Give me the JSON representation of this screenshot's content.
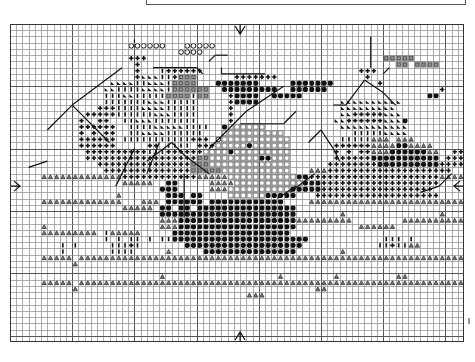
{
  "pattern": {
    "title": "Ship cross-stitch chart",
    "cols": 73,
    "rows": 51,
    "colors": {
      "grid": "#8a8a8a",
      "grid_major": "#555555",
      "ink": "#111111",
      "gray_fill": "#9a9a9a"
    },
    "legend_symbols": {
      "D": "filled-circle",
      "O": "ring-on-gray",
      "P": "plus",
      "A": "triangle",
      "S": "slash",
      "I": "bar",
      "Q": "gray-square",
      "C": "open-circle"
    },
    "center_markers": [
      "top-arrow",
      "bottom-arrow",
      "left-arrow",
      "right-arrow"
    ],
    "grid_rows": [
      ".........................................................................",
      ".........................................................................",
      "......................................................................... ",
      "...................CCCCCC...CCCCC........................................",
      "...........................CCCC..........................................",
      "...................PPP......................................QQQQQ........",
      "....................P.........................................QQ.QQQQ...",
      "....................P...IPPPPPP.........................PPP...............",
      "....................PSSSIIPQQQ......PPPPPPP..............P................",
      "................SSSSIISSSIQQQQ...DDDDDDD.....DDDDDDD.......P...............",
      "...............SSIIIISSSSIQQQQQQ..DDDDDDDDD..DDDDDD..................P.....",
      "...............IIISSIIIIIQQQQIQQ...PDDDD..DDDDD....................DD.....",
      "...............IIIIIIISSSIIIII.....PDDDD.............SSSSSSSSSS...........",
      "..............PPPIIIISSSSIIIII.....P.................SSSSSSSSS............",
      "............PPPPPIIIIIISSSIIII.....P.................SSPPPPPSSS...........",
      "...........P..PP..IISSSIIIIIII.....P................SSPPPPPPSSSD.........",
      "...........PPPPPP..IIIISSSSSIIII..DOOOOOO............SSSSSSSSSSS..........",
      "...........P.P.PP..IISSSSIIIIII...OOOOOOOOOO...........IIIIISSSS...........",
      "...........PPPPPP.IIIIIIIIIIIPPP.COOOOOOOOOOO........IIIIIAAA.AAA..........",
      "...........PPPPPP.....PP.IIII.PPPOOOOODOOOOOO.......PPPPPPAAAADDAAAA........",
      "............PPPPPPPPPPIIIPPPPPPOOOODOOOOOOOOO.......P.P.PPAAADDDDDDAA..PP..",
      "............PPPPPPPPPPPPPPPPPPQQOOOOOOOODDOOO.......PPPPPPDDDDDDDDDDD.PPP..",
      "..............PPPPPPPPPPPPPPPQQQOOOOOOOOOOOOO......PPPPPPPPDDDDDDDDDDPPPP...",
      "...............PPPPPPPPPPPPPPQQQQQOOOOOOOOOOO...AAAPPPPPPPPPPPPPPPPPPPP.....",
      ".....AAAAAAAAAAAAAPPPPPPPPPPPPAAAAAOOOOOOOOOOODDPPPPPPPPPPPPPPPPPPPPPAAAA...",
      "..................AAAAA..DD.....AAAAOOOOOOOOOOODDDPPPPPPPPPPPPPPPPPPP........",
      "........................DDD.....AAAOOOOOOOOOODDDDDPPPPPPPPPPPPPPPPPP........",
      ".................A.......DDD.DD....OOOOOODDDDD...PPPPPPPPPPPPPPPPPPPP.........",
      ".....AAAAAAAAAAAAA...AAA.DDDDDD.DDDDDDDDDDDD....AAAAAAAAAAAAAAAAAAAAAAAAAA...",
      "..................AAAAA.DD.DD.DDDDDDDDDDDDDDDD...............................",
      "........................DDDDDDDDDDDDDDDDDDDDDD.......A...............A.......",
      "........................AAADDDDDDDDDDDDDDDDDDDAAAAAAAAA........AAAAAAAAAAA...",
      ".....A..................AAADDDDDDDDDDDDDDDDDDD..........AAAAAA...............",
      ".....AAAAAAAAA.IAAAAA.....DDDDDDDDDDDDDDDDDDD...............................",
      "...............I.I.II.I.IIDDDDDDDDDDDDDDDDDDDDDD............III.I..........",
      "........I.I.....IIIPI.......DDDDDDDDDDDDDDDDDDD............IIPIIAA.........",
      "........I.......IIII.....A.....DDDDDDDDDDDDDDD.......A....................",
      ".....AAAAA.AAAAAAAAAAAAAAAAAAAAAAAAAAAAAAAAAAAAAAAAAAAAAAAAAAAAAAAAAAAAAAA..",
      "..........A..............................................................",
      ".........................................................................",
      "........................A..................A........A.........AA.........",
      ".....AAAAA.AAAAAAAAAAAAAAAAAAAAAAAAAAAAAAAAAAAAAAAAAAAAAAAAAAAAAAAAAAAAAA..",
      "..........A......................................AA.......................",
      "......................................AAA................................",
      "........................................................................."
    ]
  }
}
